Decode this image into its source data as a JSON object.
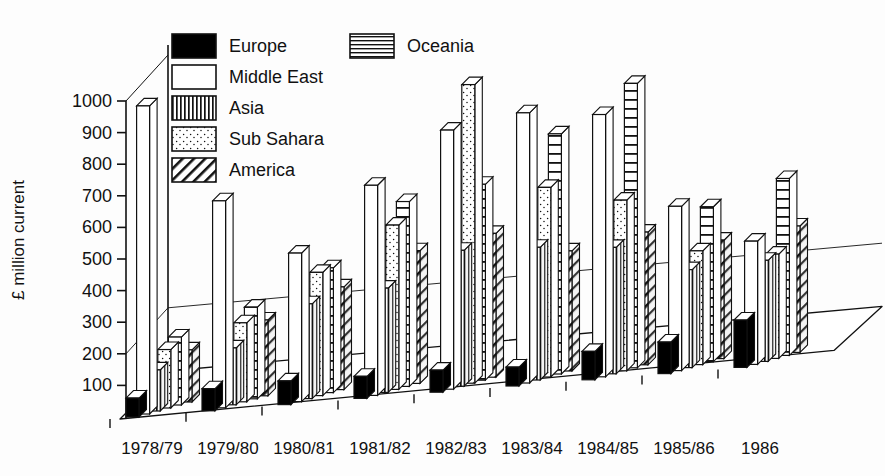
{
  "chart_data": {
    "type": "bar",
    "title": "",
    "subtitle": "",
    "xlabel": "",
    "ylabel": "£ million current",
    "ylim": [
      0,
      1000
    ],
    "yticks": [
      100,
      200,
      300,
      400,
      500,
      600,
      700,
      800,
      900,
      1000
    ],
    "grid": false,
    "legend_position": "top-center",
    "projection": "3d-isometric",
    "categories": [
      "1978/79",
      "1979/80",
      "1980/81",
      "1981/82",
      "1982/83",
      "1983/84",
      "1984/85",
      "1985/86",
      "1986"
    ],
    "series": [
      {
        "name": "Europe",
        "pattern": "solid-black",
        "values": [
          60,
          70,
          75,
          70,
          70,
          60,
          90,
          100,
          150
        ]
      },
      {
        "name": "Middle East",
        "pattern": "white",
        "values": [
          975,
          655,
          470,
          665,
          820,
          855,
          830,
          520,
          390
        ]
      },
      {
        "name": "Asia",
        "pattern": "vertical-stripes",
        "values": [
          130,
          180,
          300,
          330,
          430,
          420,
          400,
          310,
          320
        ]
      },
      {
        "name": "Sub Sahara",
        "pattern": "dotted",
        "values": [
          185,
          250,
          390,
          520,
          945,
          600,
          540,
          360,
          330
        ]
      },
      {
        "name": "Oceania",
        "pattern": "horizontal-lines",
        "values": [
          215,
          290,
          395,
          585,
          620,
          760,
          900,
          490,
          560
        ]
      },
      {
        "name": "America",
        "pattern": "diagonal-hatch",
        "values": [
          165,
          240,
          325,
          420,
          455,
          380,
          420,
          375,
          400
        ]
      }
    ]
  },
  "legend": {
    "items": [
      {
        "label": "Europe",
        "pattern": "solid-black"
      },
      {
        "label": "Middle East",
        "pattern": "white"
      },
      {
        "label": "Asia",
        "pattern": "vertical-stripes"
      },
      {
        "label": "Sub Sahara",
        "pattern": "dotted"
      },
      {
        "label": "America",
        "pattern": "diagonal-hatch"
      },
      {
        "label": "Oceania",
        "pattern": "horizontal-lines"
      }
    ]
  },
  "colors": {
    "ink": "#111111",
    "paper": "#ffffff",
    "fill_black": "#000000",
    "fill_white": "#ffffff",
    "side_shade": "#f2f2f2"
  }
}
